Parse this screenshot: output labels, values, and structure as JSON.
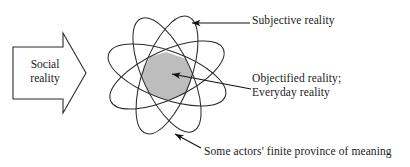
{
  "figure": {
    "background_color": "#ffffff",
    "stroke_color": "#2b2b2b",
    "shade_color": "#bdbdbd"
  },
  "input_arrow": {
    "name": "social-reality-arrow",
    "line1": "Social",
    "line2": "reality",
    "direction": "right"
  },
  "ellipses": {
    "count": 4,
    "center_x": 167,
    "center_y": 75,
    "rx": 62,
    "ry": 24,
    "rotations_deg": [
      20,
      65,
      110,
      155
    ],
    "shaded_region_label": "central overlap"
  },
  "labels": [
    {
      "key": "subjective",
      "name": "subjective-reality-label",
      "line1": "Subjective reality",
      "line2": ""
    },
    {
      "key": "objectified",
      "name": "objectified-reality-label",
      "line1": "Objectified reality;",
      "line2": "Everyday reality"
    },
    {
      "key": "province",
      "name": "finite-province-label",
      "line1": "Some actors' finite province of meaning",
      "line2": ""
    }
  ],
  "annotations": {
    "subjective": {
      "line1": "Subjective reality"
    },
    "objectified": {
      "line1": "Objectified reality;",
      "line2": "Everyday reality"
    },
    "province": {
      "line1": "Some actors' finite province of meaning"
    }
  }
}
